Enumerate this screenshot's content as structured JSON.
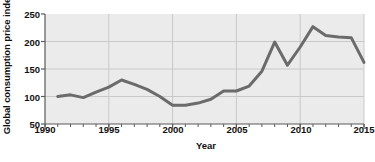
{
  "chart_data": {
    "type": "line",
    "title": "",
    "xlabel": "Year",
    "ylabel": "Global consumption price index",
    "xlim": [
      1990,
      2015
    ],
    "ylim": [
      50,
      250
    ],
    "grid": true,
    "legend": false,
    "x_ticks": [
      1990,
      1995,
      2000,
      2005,
      2010,
      2015
    ],
    "x_tick_labels": [
      "1990",
      "1995",
      "2000",
      "2005",
      "2010",
      "2015"
    ],
    "x_minor_tick_step": 1,
    "y_ticks": [
      50,
      100,
      150,
      200,
      250
    ],
    "y_tick_labels": [
      "50",
      "100",
      "150",
      "200",
      "250"
    ],
    "series": [
      {
        "name": "Global consumption price index",
        "color": "#6b6b6b",
        "line_width": 3,
        "x": [
          1991,
          1992,
          1993,
          1994,
          1995,
          1996,
          1997,
          1998,
          1999,
          2000,
          2001,
          2002,
          2003,
          2004,
          2005,
          2006,
          2007,
          2008,
          2009,
          2010,
          2011,
          2012,
          2013,
          2014,
          2015
        ],
        "values": [
          100,
          103,
          98,
          108,
          117,
          130,
          122,
          113,
          100,
          84,
          84,
          88,
          95,
          110,
          110,
          119,
          146,
          199,
          157,
          190,
          227,
          211,
          208,
          207,
          162
        ]
      }
    ]
  },
  "colors": {
    "plot_background": "#ebebeb",
    "grid": "#c9c9c9",
    "axis": "#5a5a5a",
    "line": "#6b6b6b",
    "text": "#111111"
  }
}
